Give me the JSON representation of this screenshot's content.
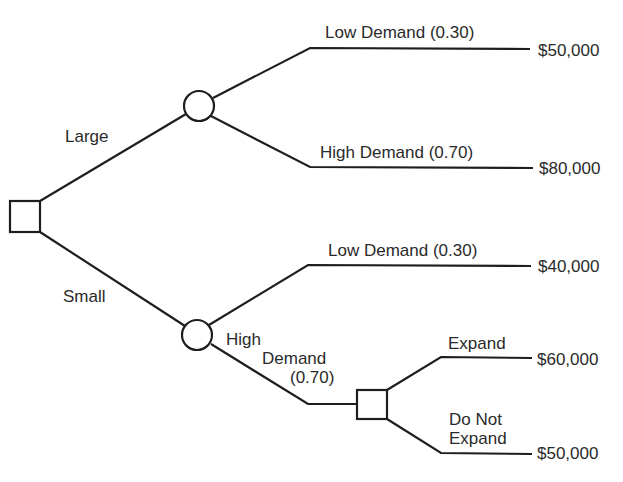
{
  "tree": {
    "decisions": [
      {
        "id": "root",
        "label": "Decision: plant size"
      },
      {
        "id": "expand-decision",
        "label": "Decision: expand"
      }
    ],
    "branches": {
      "large": "Large",
      "small": "Small",
      "large_low": "Low Demand (0.30)",
      "large_high": "High Demand (0.70)",
      "small_low": "Low Demand (0.30)",
      "small_high_line1": "High",
      "small_high_line2": "Demand",
      "small_high_line3": "(0.70)",
      "expand": "Expand",
      "no_expand_line1": "Do Not",
      "no_expand_line2": "Expand"
    },
    "payoffs": {
      "large_low": "$50,000",
      "large_high": "$80,000",
      "small_low": "$40,000",
      "expand": "$60,000",
      "no_expand": "$50,000"
    }
  },
  "colors": {
    "line": "#1e1e1e",
    "text": "#2a2a2a",
    "background": "#ffffff"
  }
}
